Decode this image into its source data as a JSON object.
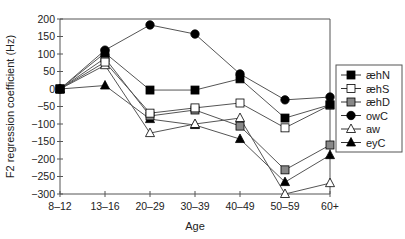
{
  "chart_data": {
    "type": "line",
    "title": "",
    "xlabel": "Age",
    "ylabel": "F2 regression coefficient (Hz)",
    "categories": [
      "8–12",
      "13–16",
      "20–29",
      "30–39",
      "40–49",
      "50–59",
      "60+"
    ],
    "ylim": [
      -300,
      200
    ],
    "yticks": [
      200,
      150,
      100,
      50,
      0,
      -50,
      -100,
      -150,
      -200,
      -250,
      -300
    ],
    "ytick_labels": [
      "200",
      "150",
      "100",
      "50",
      "0",
      "−50",
      "−100",
      "−150",
      "−200",
      "−250",
      "−300"
    ],
    "grid": false,
    "legend_position": "right",
    "series": [
      {
        "name": "æhN",
        "marker": "square",
        "fill": "#000000",
        "values": [
          0,
          103,
          -3,
          -3,
          29,
          -83,
          -45
        ]
      },
      {
        "name": "æhS",
        "marker": "square",
        "fill": "#ffffff",
        "values": [
          0,
          77,
          -69,
          -54,
          -40,
          -111,
          -46
        ]
      },
      {
        "name": "æhD",
        "marker": "square",
        "fill": "#888888",
        "values": [
          0,
          88,
          -77,
          -60,
          -106,
          -231,
          -160
        ]
      },
      {
        "name": "owC",
        "marker": "circle",
        "fill": "#000000",
        "values": [
          0,
          111,
          183,
          157,
          43,
          -31,
          -23
        ]
      },
      {
        "name": "aw",
        "marker": "triangle",
        "fill": "#ffffff",
        "values": [
          0,
          68,
          -126,
          -100,
          -83,
          -300,
          -269
        ]
      },
      {
        "name": "eyC",
        "marker": "triangle",
        "fill": "#000000",
        "values": [
          0,
          10,
          -86,
          -103,
          -143,
          -266,
          -189
        ]
      }
    ]
  }
}
